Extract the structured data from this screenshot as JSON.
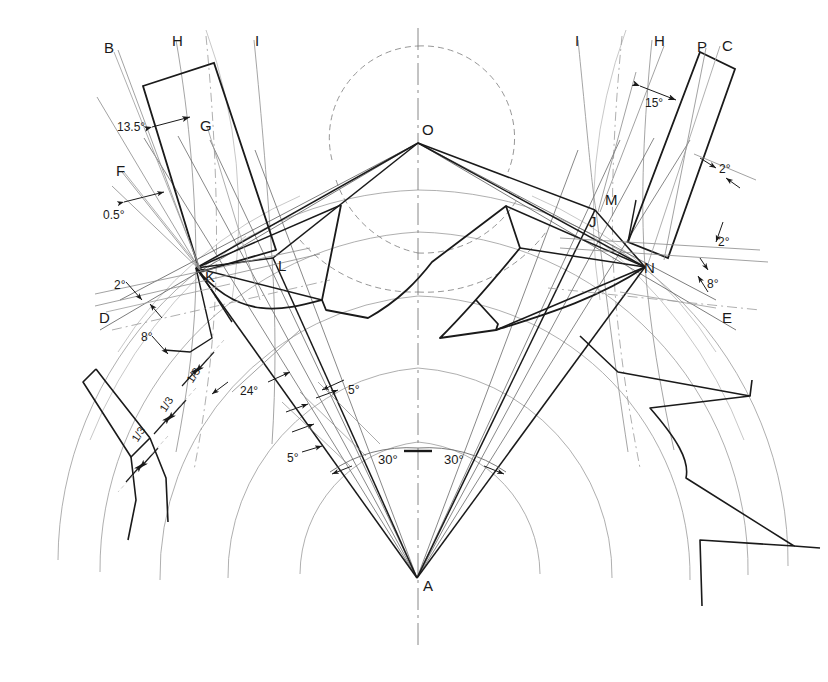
{
  "drawing": {
    "title": "Geometric construction layout",
    "background_color": "#ffffff",
    "line_color": "#1a1a1a",
    "thin_line_color": "#6b6b6b",
    "faint_line_color": "#9a9a9a",
    "dashed_line_color": "#8a8a8a"
  },
  "point_labels": [
    {
      "id": "B",
      "text": "B",
      "x": 104,
      "y": 40
    },
    {
      "id": "H_left",
      "text": "H",
      "x": 172,
      "y": 33
    },
    {
      "id": "I_left",
      "text": "I",
      "x": 255,
      "y": 33
    },
    {
      "id": "G",
      "text": "G",
      "x": 200,
      "y": 118
    },
    {
      "id": "F",
      "text": "F",
      "x": 116,
      "y": 163
    },
    {
      "id": "D",
      "text": "D",
      "x": 99,
      "y": 310
    },
    {
      "id": "K",
      "text": "K",
      "x": 205,
      "y": 269
    },
    {
      "id": "L",
      "text": "L",
      "x": 278,
      "y": 258
    },
    {
      "id": "O",
      "text": "O",
      "x": 422,
      "y": 122
    },
    {
      "id": "A",
      "text": "A",
      "x": 423,
      "y": 578
    },
    {
      "id": "I_right",
      "text": "I",
      "x": 575,
      "y": 33
    },
    {
      "id": "H_right",
      "text": "H",
      "x": 654,
      "y": 33
    },
    {
      "id": "P",
      "text": "P",
      "x": 697,
      "y": 39
    },
    {
      "id": "C",
      "text": "C",
      "x": 722,
      "y": 38
    },
    {
      "id": "M",
      "text": "M",
      "x": 605,
      "y": 192
    },
    {
      "id": "J",
      "text": "J",
      "x": 589,
      "y": 214
    },
    {
      "id": "N",
      "text": "N",
      "x": 644,
      "y": 260
    },
    {
      "id": "E",
      "text": "E",
      "x": 722,
      "y": 310
    }
  ],
  "angle_labels": [
    {
      "id": "a13_5",
      "text": "13.5°",
      "x": 117,
      "y": 121
    },
    {
      "id": "a0_5",
      "text": "0.5°",
      "x": 103,
      "y": 209
    },
    {
      "id": "a2_left",
      "text": "2°",
      "x": 114,
      "y": 279
    },
    {
      "id": "a8_left",
      "text": "8°",
      "x": 141,
      "y": 331
    },
    {
      "id": "a24",
      "text": "24°",
      "x": 240,
      "y": 385
    },
    {
      "id": "a5_upper",
      "text": "5°",
      "x": 348,
      "y": 384
    },
    {
      "id": "a5_lower",
      "text": "5°",
      "x": 287,
      "y": 452
    },
    {
      "id": "a30_left",
      "text": "30°",
      "x": 378,
      "y": 453
    },
    {
      "id": "a30_right",
      "text": "30°",
      "x": 444,
      "y": 453
    },
    {
      "id": "a15",
      "text": "15°",
      "x": 645,
      "y": 97
    },
    {
      "id": "a2_topright",
      "text": "2°",
      "x": 719,
      "y": 163
    },
    {
      "id": "a2_right",
      "text": "2°",
      "x": 718,
      "y": 236
    },
    {
      "id": "a8_right",
      "text": "8°",
      "x": 707,
      "y": 278
    }
  ],
  "fraction_labels": [
    {
      "id": "f1",
      "text": "1/3",
      "x": 186,
      "y": 370,
      "rotate": -58
    },
    {
      "id": "f2",
      "text": "1/3",
      "x": 159,
      "y": 399,
      "rotate": -58
    },
    {
      "id": "f3",
      "text": "1/3",
      "x": 131,
      "y": 429,
      "rotate": -58
    }
  ]
}
